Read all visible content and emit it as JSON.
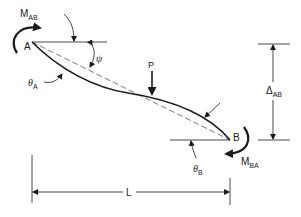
{
  "diagram": {
    "labels": {
      "moment_ab_main": "M",
      "moment_ab_sub": "AB",
      "point_a": "A",
      "psi": "ψ",
      "theta_a_main": "θ",
      "theta_a_sub": "A",
      "load": "P",
      "delta_main": "Δ",
      "delta_sub": "AB",
      "point_b": "B",
      "moment_ba_main": "M",
      "moment_ba_sub": "BA",
      "theta_b_main": "θ",
      "theta_b_sub": "B",
      "length": "L"
    },
    "colors": {
      "ink": "#1a1a1a",
      "dashed": "#555555",
      "background": "#ffffff"
    }
  }
}
